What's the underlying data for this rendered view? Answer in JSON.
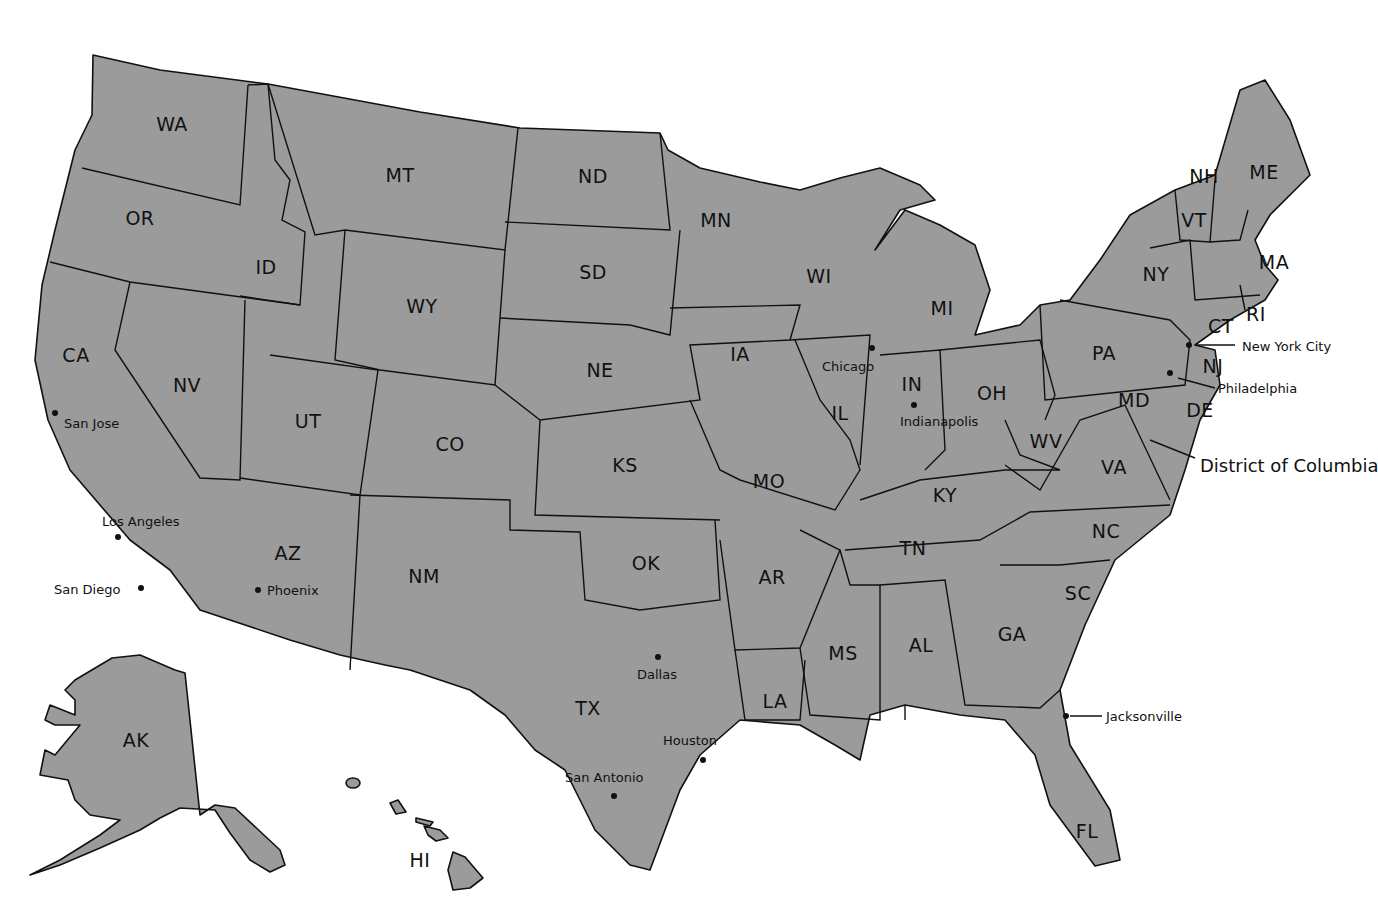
{
  "map": {
    "title": "United States",
    "fill_color": "#9b9b9b",
    "stroke_color": "#111111",
    "background": "#ffffff",
    "states": [
      {
        "abbr": "WA",
        "x": 172,
        "y": 124
      },
      {
        "abbr": "OR",
        "x": 140,
        "y": 218
      },
      {
        "abbr": "CA",
        "x": 76,
        "y": 355
      },
      {
        "abbr": "NV",
        "x": 187,
        "y": 385
      },
      {
        "abbr": "ID",
        "x": 266,
        "y": 267
      },
      {
        "abbr": "MT",
        "x": 400,
        "y": 175
      },
      {
        "abbr": "WY",
        "x": 422,
        "y": 306
      },
      {
        "abbr": "UT",
        "x": 308,
        "y": 421
      },
      {
        "abbr": "AZ",
        "x": 288,
        "y": 553
      },
      {
        "abbr": "CO",
        "x": 450,
        "y": 444
      },
      {
        "abbr": "NM",
        "x": 424,
        "y": 576
      },
      {
        "abbr": "ND",
        "x": 593,
        "y": 176
      },
      {
        "abbr": "SD",
        "x": 593,
        "y": 272
      },
      {
        "abbr": "NE",
        "x": 600,
        "y": 370
      },
      {
        "abbr": "KS",
        "x": 625,
        "y": 465
      },
      {
        "abbr": "OK",
        "x": 646,
        "y": 563
      },
      {
        "abbr": "TX",
        "x": 588,
        "y": 708
      },
      {
        "abbr": "MN",
        "x": 716,
        "y": 220
      },
      {
        "abbr": "IA",
        "x": 740,
        "y": 354
      },
      {
        "abbr": "MO",
        "x": 769,
        "y": 481
      },
      {
        "abbr": "AR",
        "x": 772,
        "y": 577
      },
      {
        "abbr": "LA",
        "x": 775,
        "y": 701
      },
      {
        "abbr": "WI",
        "x": 819,
        "y": 276
      },
      {
        "abbr": "IL",
        "x": 840,
        "y": 413
      },
      {
        "abbr": "MI",
        "x": 942,
        "y": 308
      },
      {
        "abbr": "IN",
        "x": 912,
        "y": 384
      },
      {
        "abbr": "OH",
        "x": 992,
        "y": 393
      },
      {
        "abbr": "KY",
        "x": 945,
        "y": 495
      },
      {
        "abbr": "TN",
        "x": 913,
        "y": 548
      },
      {
        "abbr": "MS",
        "x": 843,
        "y": 653
      },
      {
        "abbr": "AL",
        "x": 921,
        "y": 645
      },
      {
        "abbr": "GA",
        "x": 1012,
        "y": 634
      },
      {
        "abbr": "FL",
        "x": 1087,
        "y": 831
      },
      {
        "abbr": "SC",
        "x": 1078,
        "y": 593
      },
      {
        "abbr": "NC",
        "x": 1106,
        "y": 531
      },
      {
        "abbr": "VA",
        "x": 1114,
        "y": 467
      },
      {
        "abbr": "WV",
        "x": 1046,
        "y": 441
      },
      {
        "abbr": "MD",
        "x": 1134,
        "y": 400
      },
      {
        "abbr": "DE",
        "x": 1200,
        "y": 410
      },
      {
        "abbr": "PA",
        "x": 1104,
        "y": 353
      },
      {
        "abbr": "NJ",
        "x": 1213,
        "y": 366
      },
      {
        "abbr": "NY",
        "x": 1156,
        "y": 274
      },
      {
        "abbr": "CT",
        "x": 1221,
        "y": 326
      },
      {
        "abbr": "RI",
        "x": 1256,
        "y": 314
      },
      {
        "abbr": "MA",
        "x": 1274,
        "y": 262
      },
      {
        "abbr": "VT",
        "x": 1194,
        "y": 220
      },
      {
        "abbr": "NH",
        "x": 1204,
        "y": 176
      },
      {
        "abbr": "ME",
        "x": 1264,
        "y": 172
      },
      {
        "abbr": "AK",
        "x": 136,
        "y": 740
      },
      {
        "abbr": "HI",
        "x": 420,
        "y": 860
      }
    ],
    "cities": [
      {
        "name": "San Jose",
        "dot_x": 55,
        "dot_y": 413,
        "lx": 64,
        "ly": 416
      },
      {
        "name": "Los Angeles",
        "dot_x": 118,
        "dot_y": 537,
        "lx": 102,
        "ly": 514
      },
      {
        "name": "San Diego",
        "dot_x": 141,
        "dot_y": 588,
        "lx": 54,
        "ly": 582
      },
      {
        "name": "Phoenix",
        "dot_x": 258,
        "dot_y": 590,
        "lx": 267,
        "ly": 583
      },
      {
        "name": "Dallas",
        "dot_x": 658,
        "dot_y": 657,
        "lx": 637,
        "ly": 667
      },
      {
        "name": "Houston",
        "dot_x": 703,
        "dot_y": 760,
        "lx": 663,
        "ly": 733
      },
      {
        "name": "San Antonio",
        "dot_x": 614,
        "dot_y": 796,
        "lx": 565,
        "ly": 770
      },
      {
        "name": "Chicago",
        "dot_x": 872,
        "dot_y": 348,
        "lx": 822,
        "ly": 359
      },
      {
        "name": "Indianapolis",
        "dot_x": 914,
        "dot_y": 405,
        "lx": 900,
        "ly": 414
      },
      {
        "name": "Jacksonville",
        "dot_x": 1066,
        "dot_y": 716,
        "lx": 1106,
        "ly": 709
      },
      {
        "name": "Philadelphia",
        "dot_x": 1170,
        "dot_y": 373,
        "lx": 1218,
        "ly": 381
      },
      {
        "name": "New York City",
        "dot_x": 1189,
        "dot_y": 345,
        "lx": 1242,
        "ly": 338
      }
    ],
    "dc_label": "District of Columbia"
  }
}
